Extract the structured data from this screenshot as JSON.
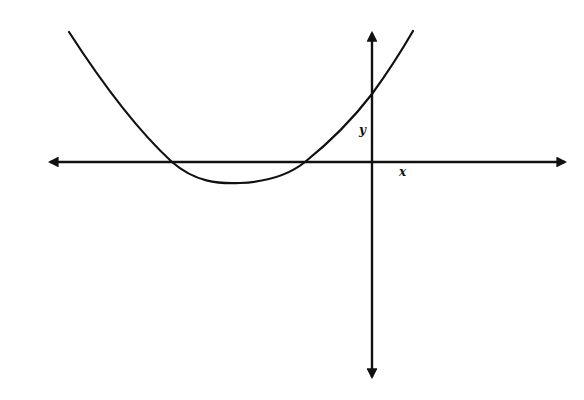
{
  "diagram": {
    "type": "coordinate-plane-parabola",
    "axes": {
      "x_label": "x",
      "y_label": "y",
      "color": "#111111"
    },
    "curve": {
      "shape": "upward-opening parabola",
      "color": "#111111",
      "features": {
        "x_intercepts": "two negative roots",
        "vertex": "below x-axis, left of y-axis",
        "y_intercept": "positive"
      }
    }
  }
}
